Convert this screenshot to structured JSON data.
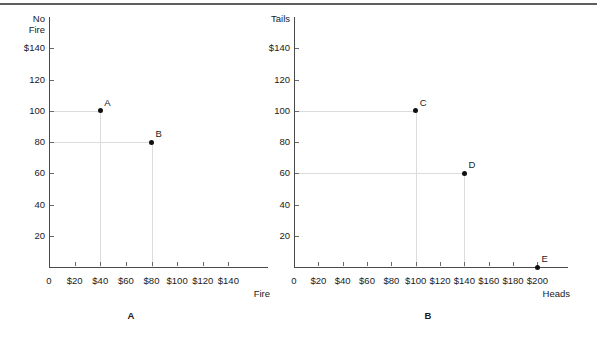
{
  "figure": {
    "panels": [
      {
        "caption": "A",
        "caption_x": 131,
        "caption_y": 311,
        "origin_x": 49,
        "origin_y": 267,
        "plot_width": 205,
        "plot_height": 250,
        "y_axis_title_line1": "No",
        "y_axis_title_line2": "Fire",
        "x_axis_title": "Fire",
        "y_ticks": [
          {
            "label": "$140",
            "value": 140
          },
          {
            "label": "120",
            "value": 120
          },
          {
            "label": "100",
            "value": 100
          },
          {
            "label": "80",
            "value": 80
          },
          {
            "label": "60",
            "value": 60
          },
          {
            "label": "40",
            "value": 40
          },
          {
            "label": "20",
            "value": 20
          }
        ],
        "y_max": 160,
        "x_ticks": [
          {
            "label": "0",
            "value": 0
          },
          {
            "label": "$20",
            "value": 20
          },
          {
            "label": "$40",
            "value": 40
          },
          {
            "label": "$60",
            "value": 60
          },
          {
            "label": "$80",
            "value": 80
          },
          {
            "label": "$100",
            "value": 100
          },
          {
            "label": "$120",
            "value": 120
          },
          {
            "label": "$140",
            "value": 140
          }
        ],
        "x_max": 160,
        "points": [
          {
            "label": "A",
            "x": 40,
            "y": 100
          },
          {
            "label": "B",
            "x": 80,
            "y": 80
          }
        ]
      },
      {
        "caption": "B",
        "caption_x": 428,
        "caption_y": 311,
        "origin_x": 294,
        "origin_y": 267,
        "plot_width": 260,
        "plot_height": 250,
        "y_axis_title_line1": "Tails",
        "y_axis_title_line2": "",
        "x_axis_title": "Heads",
        "y_ticks": [
          {
            "label": "$140",
            "value": 140
          },
          {
            "label": "120",
            "value": 120
          },
          {
            "label": "100",
            "value": 100
          },
          {
            "label": "80",
            "value": 80
          },
          {
            "label": "60",
            "value": 60
          },
          {
            "label": "40",
            "value": 40
          },
          {
            "label": "20",
            "value": 20
          }
        ],
        "y_max": 160,
        "x_ticks": [
          {
            "label": "0",
            "value": 0
          },
          {
            "label": "$20",
            "value": 22
          },
          {
            "label": "$40",
            "value": 44
          },
          {
            "label": "$60",
            "value": 66
          },
          {
            "label": "$80",
            "value": 88
          },
          {
            "label": "$100",
            "value": 110
          },
          {
            "label": "$120",
            "value": 132
          },
          {
            "label": "$140",
            "value": 154
          },
          {
            "label": "$160",
            "value": 176
          },
          {
            "label": "$180",
            "value": 198
          },
          {
            "label": "$200",
            "value": 220
          }
        ],
        "x_max": 235,
        "points": [
          {
            "label": "C",
            "x": 110,
            "y": 100
          },
          {
            "label": "D",
            "x": 154,
            "y": 60
          },
          {
            "label": "E",
            "x": 220,
            "y": 0
          }
        ]
      }
    ]
  },
  "chart_data": {
    "type": "scatter",
    "title": "",
    "panels": [
      {
        "name": "A",
        "xlabel": "Fire",
        "ylabel": "No Fire",
        "xlim": [
          0,
          160
        ],
        "ylim": [
          0,
          160
        ],
        "xticks": [
          0,
          20,
          40,
          60,
          80,
          100,
          120,
          140
        ],
        "xticklabels": [
          "0",
          "$20",
          "$40",
          "$60",
          "$80",
          "$100",
          "$120",
          "$140"
        ],
        "yticks": [
          20,
          40,
          60,
          80,
          100,
          120,
          140
        ],
        "yticklabels": [
          "20",
          "40",
          "60",
          "80",
          "100",
          "120",
          "$140"
        ],
        "grid": false,
        "legend": "none",
        "points": [
          {
            "label": "A",
            "x": 40,
            "y": 100
          },
          {
            "label": "B",
            "x": 80,
            "y": 80
          }
        ],
        "annotations": [
          "Dotted guide lines drop from each point to both axes"
        ]
      },
      {
        "name": "B",
        "xlabel": "Heads",
        "ylabel": "Tails",
        "xlim": [
          0,
          235
        ],
        "ylim": [
          0,
          160
        ],
        "xticks": [
          0,
          20,
          40,
          60,
          80,
          100,
          120,
          140,
          160,
          180,
          200
        ],
        "xticklabels": [
          "0",
          "$20",
          "$40",
          "$60",
          "$80",
          "$100",
          "$120",
          "$140",
          "$160",
          "$180",
          "$200"
        ],
        "yticks": [
          20,
          40,
          60,
          80,
          100,
          120,
          140
        ],
        "yticklabels": [
          "20",
          "40",
          "60",
          "80",
          "100",
          "120",
          "$140"
        ],
        "grid": false,
        "legend": "none",
        "points": [
          {
            "label": "C",
            "x": 100,
            "y": 100
          },
          {
            "label": "D",
            "x": 140,
            "y": 60
          },
          {
            "label": "E",
            "x": 200,
            "y": 0
          }
        ],
        "annotations": [
          "Dotted guide lines drop from each point to both axes"
        ]
      }
    ]
  }
}
